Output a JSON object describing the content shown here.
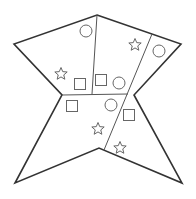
{
  "diagram": {
    "width": 196,
    "height": 199,
    "colors": {
      "outline": "#333333",
      "divider": "#555555",
      "shape": "#666666",
      "background": "#ffffff"
    },
    "outline_points": [
      [
        97,
        15
      ],
      [
        181,
        44
      ],
      [
        134,
        95
      ],
      [
        182,
        183
      ],
      [
        99,
        148
      ],
      [
        15,
        183
      ],
      [
        62,
        95
      ],
      [
        14,
        44
      ]
    ],
    "dividers": [
      {
        "x1": 97,
        "y1": 15,
        "x2": 92,
        "y2": 94
      },
      {
        "x1": 62,
        "y1": 95,
        "x2": 128,
        "y2": 94
      },
      {
        "x1": 152,
        "y1": 34,
        "x2": 104,
        "y2": 150
      }
    ],
    "shapes": [
      {
        "type": "circle",
        "cx": 86,
        "cy": 31,
        "r": 6
      },
      {
        "type": "star",
        "cx": 135,
        "cy": 45,
        "r": 5
      },
      {
        "type": "circle",
        "cx": 159,
        "cy": 51,
        "r": 6
      },
      {
        "type": "star",
        "cx": 61,
        "cy": 74,
        "r": 5
      },
      {
        "type": "square",
        "cx": 80,
        "cy": 84,
        "size": 11
      },
      {
        "type": "square",
        "cx": 101,
        "cy": 80,
        "size": 11
      },
      {
        "type": "circle",
        "cx": 119,
        "cy": 83,
        "r": 6
      },
      {
        "type": "square",
        "cx": 72,
        "cy": 106,
        "size": 11
      },
      {
        "type": "circle",
        "cx": 111,
        "cy": 105,
        "r": 6
      },
      {
        "type": "square",
        "cx": 129,
        "cy": 115,
        "size": 11
      },
      {
        "type": "star",
        "cx": 98,
        "cy": 129,
        "r": 5
      },
      {
        "type": "star",
        "cx": 120,
        "cy": 148,
        "r": 5
      }
    ]
  }
}
